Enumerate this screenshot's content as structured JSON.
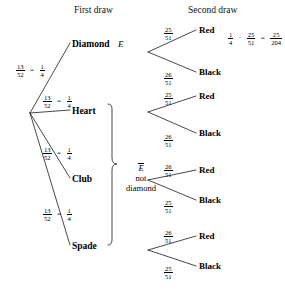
{
  "diagram": {
    "type": "probability-tree",
    "title_headers": {
      "first": "First draw",
      "second": "Second draw"
    },
    "root": {
      "label": "",
      "x": 30,
      "y": 113
    },
    "first_draw": {
      "branch_probability_numerator": "13",
      "branch_probability_denominator": "52",
      "branch_probability_simple_numerator": "1",
      "branch_probability_simple_denominator": "4",
      "equals": "=",
      "nodes": [
        {
          "label": "Diamond",
          "event": "E",
          "x": 72,
          "y": 45
        },
        {
          "label": "Heart",
          "event": "",
          "x": 72,
          "y": 112
        },
        {
          "label": "Club",
          "event": "",
          "x": 72,
          "y": 180
        },
        {
          "label": "Spade",
          "event": "",
          "x": 72,
          "y": 247
        }
      ]
    },
    "complement_brace": {
      "symbol": "E",
      "line2": "not",
      "line3": "diamond"
    },
    "second_draw": {
      "subtrees": [
        {
          "parent": "Diamond",
          "leaves": [
            {
              "label": "Red",
              "num": "25",
              "den": "51"
            },
            {
              "label": "Black",
              "num": "26",
              "den": "51"
            }
          ]
        },
        {
          "parent": "Heart",
          "leaves": [
            {
              "label": "Red",
              "num": "25",
              "den": "51"
            },
            {
              "label": "Black",
              "num": "26",
              "den": "51"
            }
          ]
        },
        {
          "parent": "Club",
          "leaves": [
            {
              "label": "Red",
              "num": "26",
              "den": "51"
            },
            {
              "label": "Black",
              "num": "25",
              "den": "51"
            }
          ]
        },
        {
          "parent": "Spade",
          "leaves": [
            {
              "label": "Red",
              "num": "26",
              "den": "51"
            },
            {
              "label": "Black",
              "num": "25",
              "den": "51"
            }
          ]
        }
      ]
    },
    "computation": {
      "a_num": "1",
      "a_den": "4",
      "dot": "·",
      "b_num": "25",
      "b_den": "51",
      "equals": "=",
      "result_num": "25",
      "result_den": "204"
    },
    "colors": {
      "ink": "#000000",
      "background": "#ffffff",
      "line": "#1a1a1a"
    }
  }
}
